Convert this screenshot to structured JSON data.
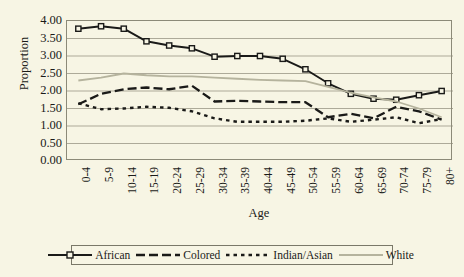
{
  "chart_data": {
    "type": "line",
    "title": "",
    "xlabel": "Age",
    "ylabel": "Proportion",
    "ylim": [
      0.0,
      4.0
    ],
    "ytick_step": 0.5,
    "grid": true,
    "legend_position": "bottom",
    "categories": [
      "0-4",
      "5-9",
      "10-14",
      "15-19",
      "20-24",
      "25-29",
      "30-34",
      "35-39",
      "40-44",
      "45-49",
      "50-54",
      "55-59",
      "60-64",
      "65-69",
      "70-74",
      "75-79",
      "80+"
    ],
    "ytick_labels": [
      "4.00",
      "3.50",
      "3.00",
      "2.50",
      "2.00",
      "1.50",
      "1.00",
      "0.50",
      "0.00"
    ],
    "ytick_values": [
      4.0,
      3.5,
      3.0,
      2.5,
      2.0,
      1.5,
      1.0,
      0.5,
      0.0
    ],
    "series": [
      {
        "name": "African",
        "color": "#1a1a18",
        "style": "solid-square-markers",
        "values": [
          3.78,
          3.85,
          3.78,
          3.42,
          3.3,
          3.22,
          2.98,
          3.0,
          3.0,
          2.92,
          2.62,
          2.22,
          1.92,
          1.78,
          1.75,
          1.88,
          2.0
        ]
      },
      {
        "name": "Colored",
        "color": "#1a1a18",
        "style": "long-dash",
        "values": [
          1.62,
          1.92,
          2.05,
          2.1,
          2.05,
          2.15,
          1.7,
          1.72,
          1.7,
          1.68,
          1.68,
          1.25,
          1.35,
          1.22,
          1.55,
          1.42,
          1.18
        ]
      },
      {
        "name": "Indian/Asian",
        "color": "#1a1a18",
        "style": "short-dash",
        "values": [
          1.65,
          1.48,
          1.5,
          1.55,
          1.52,
          1.42,
          1.22,
          1.12,
          1.12,
          1.12,
          1.15,
          1.22,
          1.12,
          1.18,
          1.25,
          1.08,
          1.2
        ]
      },
      {
        "name": "White",
        "color": "#b5b39d",
        "style": "solid-light",
        "values": [
          2.3,
          2.38,
          2.5,
          2.45,
          2.42,
          2.42,
          2.38,
          2.35,
          2.32,
          2.3,
          2.28,
          2.12,
          1.95,
          1.82,
          1.7,
          1.5,
          1.25
        ]
      }
    ]
  }
}
